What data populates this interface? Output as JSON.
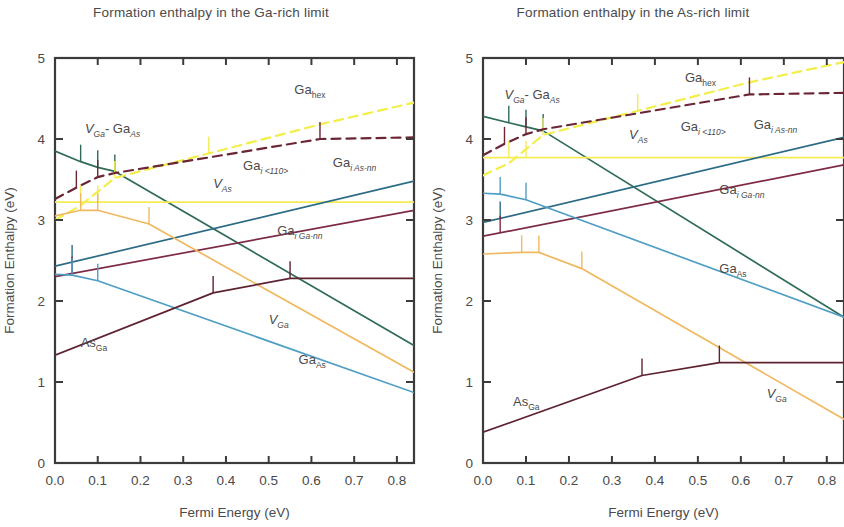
{
  "figure": {
    "y_axis_title": "Formation Enthalpy (eV)",
    "x_axis_title": "Fermi Energy (eV)"
  },
  "panels": [
    {
      "id": "ga-rich",
      "title": "Formation enthalpy in the Ga-rich limit"
    },
    {
      "id": "as-rich",
      "title": "Formation enthalpy in the As-rich limit"
    }
  ],
  "axes": {
    "x_ticks": [
      "0.0",
      "0.1",
      "0.2",
      "0.3",
      "0.4",
      "0.5",
      "0.6",
      "0.7",
      "0.8"
    ],
    "y_ticks": [
      "0",
      "1",
      "2",
      "3",
      "4",
      "5"
    ],
    "xlim": [
      0.0,
      0.84
    ],
    "ylim": [
      0,
      5
    ]
  },
  "colors": {
    "v_ga_ga_as": "#2f6b57",
    "ga_hex": "#f2ee4a",
    "ga_i_110": "#6b2535",
    "v_as": "#f5ec55",
    "ga_i_as_nn": "#2b6b86",
    "ga_i_ga_nn": "#7d2a45",
    "v_ga": "#f0b860",
    "ga_as": "#4f9ec4",
    "as_ga": "#5e2230",
    "axis": "#3b3b3b"
  },
  "chart_data": [
    {
      "type": "line",
      "title": "Formation enthalpy in the Ga-rich limit",
      "xlabel": "Fermi Energy (eV)",
      "ylabel": "Formation Enthalpy (eV)",
      "xlim": [
        0.0,
        0.84
      ],
      "ylim": [
        0,
        5
      ],
      "grid": false,
      "legend": "inline-labels",
      "series": [
        {
          "name": "V_Ga - Ga_As",
          "label": "V",
          "sub": "Ga",
          "label2": "- Ga",
          "sub2": "As",
          "style": "solid",
          "color": "#2f6b57",
          "x": [
            0.0,
            0.06,
            0.1,
            0.14,
            0.84
          ],
          "y": [
            3.85,
            3.72,
            3.65,
            3.6,
            1.45
          ],
          "kinks_x": [
            0.06,
            0.1,
            0.14
          ],
          "label_x": 0.07,
          "label_y": 4.08
        },
        {
          "name": "Ga_hex",
          "label": "Ga",
          "sub": "hex",
          "style": "dashed",
          "color": "#f2ee4a",
          "x": [
            0.0,
            0.06,
            0.14,
            0.62,
            0.84
          ],
          "y": [
            3.0,
            3.18,
            3.52,
            4.18,
            4.45
          ],
          "kinks_x": [
            0.14,
            0.36
          ],
          "label_x": 0.56,
          "label_y": 4.55
        },
        {
          "name": "Ga_i<110>",
          "label": "Ga",
          "sub": "i <110>",
          "style": "dashed",
          "color": "#6b2535",
          "x": [
            0.0,
            0.05,
            0.1,
            0.14,
            0.62,
            0.84
          ],
          "y": [
            3.26,
            3.4,
            3.53,
            3.58,
            4.0,
            4.02
          ],
          "kinks_x": [
            0.05,
            0.1,
            0.62
          ],
          "label_x": 0.44,
          "label_y": 3.62
        },
        {
          "name": "V_As",
          "label": "V",
          "sub": "As",
          "style": "solid",
          "color": "#f5ec55",
          "x": [
            0.0,
            0.84
          ],
          "y": [
            3.22,
            3.22
          ],
          "kinks_x": [
            0.06,
            0.1
          ],
          "label_x": 0.37,
          "label_y": 3.4
        },
        {
          "name": "Ga_i As-nn",
          "label": "Ga",
          "sub": "i As-nn",
          "style": "solid",
          "color": "#2b6b86",
          "x": [
            0.0,
            0.84
          ],
          "y": [
            2.43,
            3.48
          ],
          "kinks_x": [
            0.04
          ],
          "label_x": 0.65,
          "label_y": 3.65
        },
        {
          "name": "Ga_i Ga-nn",
          "label": "Ga",
          "sub": "i Ga-nn",
          "style": "solid",
          "color": "#7d2a45",
          "x": [
            0.0,
            0.84
          ],
          "y": [
            2.3,
            3.12
          ],
          "kinks_x": [
            0.04
          ],
          "label_x": 0.52,
          "label_y": 2.82
        },
        {
          "name": "V_Ga",
          "label": "V",
          "sub": "Ga",
          "style": "solid",
          "color": "#f0b860",
          "x": [
            0.0,
            0.06,
            0.1,
            0.22,
            0.84
          ],
          "y": [
            3.05,
            3.12,
            3.12,
            2.95,
            1.12
          ],
          "kinks_x": [
            0.06,
            0.1,
            0.22
          ],
          "label_x": 0.5,
          "label_y": 1.72
        },
        {
          "name": "Ga_As",
          "label": "Ga",
          "sub": "As",
          "style": "solid",
          "color": "#4f9ec4",
          "x": [
            0.0,
            0.04,
            0.1,
            0.84
          ],
          "y": [
            2.33,
            2.32,
            2.25,
            0.87
          ],
          "kinks_x": [
            0.04,
            0.1
          ],
          "label_x": 0.57,
          "label_y": 1.22
        },
        {
          "name": "As_Ga",
          "label": "As",
          "sub": "Ga",
          "style": "solid",
          "color": "#5e2230",
          "x": [
            0.0,
            0.37,
            0.55,
            0.84
          ],
          "y": [
            1.33,
            2.1,
            2.28,
            2.28
          ],
          "kinks_x": [
            0.37,
            0.55
          ],
          "label_x": 0.06,
          "label_y": 1.43
        }
      ]
    },
    {
      "type": "line",
      "title": "Formation enthalpy in the As-rich limit",
      "xlabel": "Fermi Energy (eV)",
      "ylabel": "Formation Enthalpy (eV)",
      "xlim": [
        0.0,
        0.84
      ],
      "ylim": [
        0,
        5
      ],
      "grid": false,
      "legend": "inline-labels",
      "series": [
        {
          "name": "V_Ga - Ga_As",
          "label": "V",
          "sub": "Ga",
          "label2": "- Ga",
          "sub2": "As",
          "style": "solid",
          "color": "#2f6b57",
          "x": [
            0.0,
            0.06,
            0.1,
            0.14,
            0.84
          ],
          "y": [
            4.28,
            4.2,
            4.15,
            4.1,
            1.8
          ],
          "kinks_x": [
            0.06,
            0.1,
            0.14
          ],
          "label_x": 0.05,
          "label_y": 4.5
        },
        {
          "name": "Ga_hex",
          "label": "Ga",
          "sub": "hex",
          "style": "dashed",
          "color": "#f2ee4a",
          "x": [
            0.0,
            0.06,
            0.14,
            0.62,
            0.84
          ],
          "y": [
            3.55,
            3.7,
            4.05,
            4.7,
            4.95
          ],
          "kinks_x": [
            0.14,
            0.36
          ],
          "label_x": 0.47,
          "label_y": 4.7
        },
        {
          "name": "Ga_i<110>",
          "label": "Ga",
          "sub": "i <110>",
          "style": "dashed",
          "color": "#6b2535",
          "x": [
            0.0,
            0.05,
            0.1,
            0.14,
            0.62,
            0.84
          ],
          "y": [
            3.8,
            3.94,
            4.06,
            4.12,
            4.55,
            4.57
          ],
          "kinks_x": [
            0.05,
            0.1,
            0.62
          ],
          "label_x": 0.46,
          "label_y": 4.1
        },
        {
          "name": "V_As",
          "label": "V",
          "sub": "As",
          "style": "solid",
          "color": "#f5ec55",
          "x": [
            0.0,
            0.84
          ],
          "y": [
            3.77,
            3.77
          ],
          "kinks_x": [
            0.06,
            0.1
          ],
          "label_x": 0.34,
          "label_y": 4.0
        },
        {
          "name": "Ga_i As-nn",
          "label": "Ga",
          "sub": "i As-nn",
          "style": "solid",
          "color": "#2b6b86",
          "x": [
            0.0,
            0.84
          ],
          "y": [
            2.97,
            4.02
          ],
          "kinks_x": [
            0.04
          ],
          "label_x": 0.63,
          "label_y": 4.12
        },
        {
          "name": "Ga_i Ga-nn",
          "label": "Ga",
          "sub": "i Ga-nn",
          "style": "solid",
          "color": "#7d2a45",
          "x": [
            0.0,
            0.84
          ],
          "y": [
            2.8,
            3.68
          ],
          "kinks_x": [
            0.04
          ],
          "label_x": 0.55,
          "label_y": 3.32
        },
        {
          "name": "V_Ga",
          "label": "V",
          "sub": "Ga",
          "style": "solid",
          "color": "#f0b860",
          "x": [
            0.0,
            0.09,
            0.13,
            0.23,
            0.84
          ],
          "y": [
            2.58,
            2.6,
            2.6,
            2.4,
            0.54
          ],
          "kinks_x": [
            0.09,
            0.13,
            0.23
          ],
          "label_x": 0.66,
          "label_y": 0.8
        },
        {
          "name": "Ga_As",
          "label": "Ga",
          "sub": "As",
          "style": "solid",
          "color": "#4f9ec4",
          "x": [
            0.0,
            0.04,
            0.1,
            0.84
          ],
          "y": [
            3.33,
            3.32,
            3.25,
            1.8
          ],
          "kinks_x": [
            0.04,
            0.1
          ],
          "label_x": 0.55,
          "label_y": 2.35
        },
        {
          "name": "As_Ga",
          "label": "As",
          "sub": "Ga",
          "style": "solid",
          "color": "#5e2230",
          "x": [
            0.0,
            0.37,
            0.55,
            0.84
          ],
          "y": [
            0.38,
            1.08,
            1.24,
            1.24
          ],
          "kinks_x": [
            0.37,
            0.55
          ],
          "label_x": 0.07,
          "label_y": 0.7
        }
      ]
    }
  ]
}
